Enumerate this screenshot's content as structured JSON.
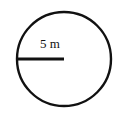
{
  "diagram": {
    "shape": "circle",
    "radius_label": "5 m",
    "radius_value": 5,
    "unit": "m",
    "stroke_color": "#111111",
    "background": "#ffffff"
  }
}
